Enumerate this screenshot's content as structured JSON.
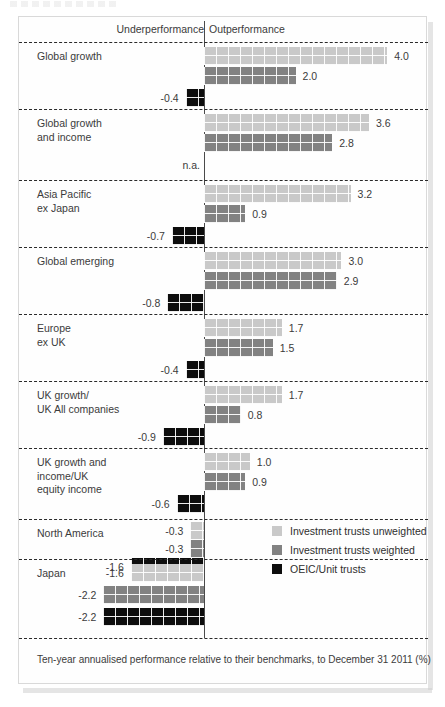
{
  "figure": {
    "axis_left_label": "Underperformance",
    "axis_right_label": "Outperformance",
    "footer_caption": "Ten-year annualised performance relative to their benchmarks, to December 31 2011 (%)"
  },
  "legend": {
    "items": [
      {
        "label": "Investment trusts unweighted",
        "color": "#c9c9c9",
        "swatch_icon": "square-swatch-light"
      },
      {
        "label": "Investment trusts weighted",
        "color": "#828282",
        "swatch_icon": "square-swatch-mid"
      },
      {
        "label": "OEIC/Unit trusts",
        "color": "#0d0d0d",
        "swatch_icon": "square-swatch-dark"
      }
    ]
  },
  "chart_data": {
    "type": "bar",
    "orientation": "horizontal",
    "title": "",
    "subtitle": "",
    "xlabel": "Ten-year annualised performance relative to their benchmarks, to December 31 2011 (%)",
    "ylabel": "",
    "grid": false,
    "zero_line": true,
    "legend_position": "middle-right",
    "xlim": [
      -2.4,
      4.4
    ],
    "left_region_label": "Underperformance",
    "right_region_label": "Outperformance",
    "series": [
      {
        "name": "Investment trusts unweighted",
        "color": "#c9c9c9",
        "values": [
          4.0,
          3.6,
          3.2,
          3.0,
          1.7,
          1.7,
          1.0,
          -0.3,
          -1.6
        ],
        "labels": [
          "4.0",
          "3.6",
          "3.2",
          "3.0",
          "1.7",
          "1.7",
          "1.0",
          "-0.3",
          "-1.6"
        ]
      },
      {
        "name": "Investment trusts weighted",
        "color": "#828282",
        "values": [
          2.0,
          2.8,
          0.9,
          2.9,
          1.5,
          0.8,
          0.9,
          -0.3,
          -2.2
        ],
        "labels": [
          "2.0",
          "2.8",
          "0.9",
          "2.9",
          "1.5",
          "0.8",
          "0.9",
          "-0.3",
          "-2.2"
        ]
      },
      {
        "name": "OEIC/Unit trusts",
        "color": "#0d0d0d",
        "values": [
          -0.4,
          null,
          -0.7,
          -0.8,
          -0.4,
          -0.9,
          -0.6,
          -1.6,
          -2.2
        ],
        "labels": [
          "-0.4",
          "n.a.",
          "-0.7",
          "-0.8",
          "-0.4",
          "-0.9",
          "-0.6",
          "-1.6",
          "-2.2"
        ]
      }
    ],
    "categories": [
      "Global growth",
      "Global growth\nand income",
      "Asia Pacific\nex Japan",
      "Global emerging",
      "Europe\nex UK",
      "UK growth/\nUK All companies",
      "UK growth and\nincome/UK\nequity income",
      "North America",
      "Japan"
    ]
  }
}
